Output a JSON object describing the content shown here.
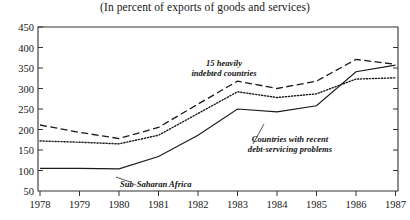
{
  "title": "(In percent of exports of goods and services)",
  "chart_data": {
    "type": "line",
    "title": "(In percent of exports of goods and services)",
    "xlabel": "",
    "ylabel": "",
    "x": [
      1978,
      1979,
      1980,
      1981,
      1982,
      1983,
      1984,
      1985,
      1986,
      1987
    ],
    "xtick_labels": [
      "1978",
      "1979",
      "1980",
      "1981",
      "1982",
      "1983",
      "1984",
      "1985",
      "1986",
      "1987"
    ],
    "ytick_labels": [
      "50",
      "100",
      "150",
      "200",
      "250",
      "300",
      "350",
      "400",
      "450"
    ],
    "ylim": [
      50,
      450
    ],
    "xlim": [
      1977.6,
      1987.6
    ],
    "grid": false,
    "legend_position": "inline-annotations",
    "series": [
      {
        "name": "15 heavily indebted countries",
        "style": "dashed",
        "values": [
          211,
          193,
          178,
          205,
          262,
          318,
          300,
          318,
          371,
          359
        ]
      },
      {
        "name": "Countries with recent debt-servicing problems",
        "style": "dotted",
        "values": [
          172,
          169,
          165,
          186,
          239,
          292,
          278,
          287,
          323,
          326
        ]
      },
      {
        "name": "Sub-Saharan Africa",
        "style": "solid",
        "values": [
          105,
          105,
          104,
          134,
          186,
          250,
          243,
          258,
          341,
          357
        ]
      }
    ],
    "annotations": [
      {
        "name": "15 heavily indebted countries",
        "line1": "15 heavily",
        "line2": "indebted countries"
      },
      {
        "name": "Countries with recent debt-servicing problems",
        "line1": "Countries with recent",
        "line2": "debt-servicing problems"
      },
      {
        "name": "Sub-Saharan Africa",
        "line1": "Sub-Saharan Africa",
        "line2": ""
      }
    ]
  }
}
